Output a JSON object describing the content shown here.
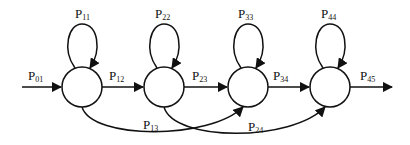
{
  "diagram": {
    "type": "markov-chain-state-transition",
    "states": [
      {
        "id": "s1",
        "cx": 82,
        "cy": 87,
        "r": 20
      },
      {
        "id": "s2",
        "cx": 164,
        "cy": 87,
        "r": 20
      },
      {
        "id": "s3",
        "cx": 248,
        "cy": 87,
        "r": 20
      },
      {
        "id": "s4",
        "cx": 330,
        "cy": 87,
        "r": 20
      }
    ],
    "labels": {
      "p01": {
        "main": "P",
        "sub": "01"
      },
      "p11": {
        "main": "P",
        "sub": "11"
      },
      "p12": {
        "main": "P",
        "sub": "12"
      },
      "p22": {
        "main": "P",
        "sub": "22"
      },
      "p23": {
        "main": "P",
        "sub": "23"
      },
      "p33": {
        "main": "P",
        "sub": "33"
      },
      "p34": {
        "main": "P",
        "sub": "34"
      },
      "p44": {
        "main": "P",
        "sub": "44"
      },
      "p45": {
        "main": "P",
        "sub": "45"
      },
      "p13": {
        "main": "P",
        "sub": "13"
      },
      "p24": {
        "main": "P",
        "sub": "24"
      }
    },
    "colors": {
      "stroke": "#111111",
      "background": "#ffffff"
    }
  }
}
